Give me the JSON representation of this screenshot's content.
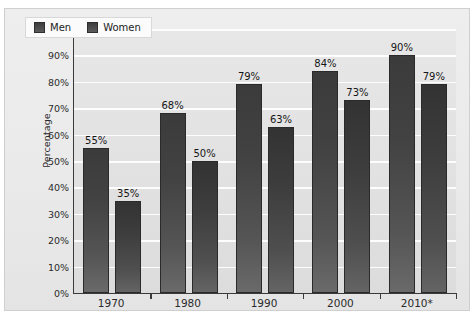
{
  "chart_data": {
    "type": "bar",
    "title": "",
    "xlabel": "",
    "ylabel": "Percentage",
    "ylim": [
      0,
      100
    ],
    "grid": true,
    "legend_position": "top-left",
    "categories": [
      "1970",
      "1980",
      "1990",
      "2000",
      "2010*"
    ],
    "series": [
      {
        "name": "Men",
        "values": [
          55,
          68,
          79,
          84,
          90
        ]
      },
      {
        "name": "Women",
        "values": [
          35,
          50,
          63,
          73,
          79
        ]
      }
    ],
    "y_ticks": [
      "0%",
      "10%",
      "20%",
      "30%",
      "40%",
      "50%",
      "60%",
      "70%",
      "80%",
      "90%",
      "100%"
    ],
    "y_tick_values": [
      0,
      10,
      20,
      30,
      40,
      50,
      60,
      70,
      80,
      90,
      100
    ],
    "data_labels": {
      "Men": [
        "55%",
        "68%",
        "79%",
        "84%",
        "90%"
      ],
      "Women": [
        "35%",
        "50%",
        "63%",
        "73%",
        "79%"
      ]
    },
    "colors": {
      "men_bar": "#3f3f3f",
      "women_bar": "#3a3a3a",
      "plot_background": "#e3e3e3",
      "chart_background": "#eaeaea",
      "gridline": "#fdfdfd",
      "axis": "#3a3a3a",
      "text": "#2b2b2b"
    }
  },
  "legend": {
    "items": [
      {
        "label": "Men"
      },
      {
        "label": "Women"
      }
    ]
  },
  "axes": {
    "y_title": "Percentage"
  }
}
